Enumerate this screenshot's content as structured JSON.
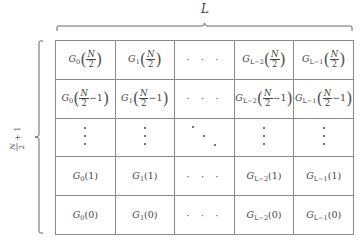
{
  "diagram": {
    "type": "matrix-layout",
    "top_brace": {
      "label": "L",
      "meaning": "number of columns"
    },
    "left_brace": {
      "label": "N/2 + 1",
      "label_numerator": "N",
      "label_denominator": "2",
      "label_suffix": "+ 1",
      "meaning": "number of rows"
    },
    "columns": [
      "G_0",
      "G_1",
      "…",
      "G_{L-2}",
      "G_{L-1}"
    ],
    "column_symbols": [
      {
        "base": "G",
        "sub": "0"
      },
      {
        "base": "G",
        "sub": "1"
      },
      {
        "base": "",
        "sub": ""
      },
      {
        "base": "G",
        "sub": "L−2"
      },
      {
        "base": "G",
        "sub": "L−1"
      }
    ],
    "rows": [
      {
        "arg_type": "frac",
        "num": "N",
        "den": "2",
        "suffix": ""
      },
      {
        "arg_type": "frac",
        "num": "N",
        "den": "2",
        "suffix": "−1"
      },
      {
        "arg_type": "vdots"
      },
      {
        "arg_type": "plain",
        "value": "(1)"
      },
      {
        "arg_type": "plain",
        "value": "(0)"
      }
    ],
    "cells": [
      [
        "G_0(N/2)",
        "G_1(N/2)",
        "· · ·",
        "G_{L-2}(N/2)",
        "G_{L-1}(N/2)"
      ],
      [
        "G_0(N/2 - 1)",
        "G_1(N/2 - 1)",
        "· · ·",
        "G_{L-2}(N/2 - 1)",
        "G_{L-1}(N/2 - 1)"
      ],
      [
        "⋮",
        "⋮",
        "⋱",
        "⋮",
        "⋮"
      ],
      [
        "G_0(1)",
        "G_1(1)",
        "· · ·",
        "G_{L-2}(1)",
        "G_{L-1}(1)"
      ],
      [
        "G_0(0)",
        "G_1(0)",
        "· · ·",
        "G_{L-2}(0)",
        "G_{L-1}(0)"
      ]
    ],
    "text": {
      "top_label": "L",
      "left_num": "N",
      "left_den": "2",
      "left_suffix": "+ 1",
      "G": "G",
      "sub0": "0",
      "sub1": "1",
      "subL2": "L−2",
      "subL1": "L−1",
      "N": "N",
      "two": "2",
      "minus1": "−1",
      "lparen": "(",
      "rparen": ")",
      "arg1": "(1)",
      "arg0": "(0)",
      "hdots": "· · ·",
      "vdots": "·\n·\n·"
    },
    "colors": {
      "grid_line": "#8a8a8a",
      "text": "#444444",
      "background": "#ffffff"
    }
  }
}
